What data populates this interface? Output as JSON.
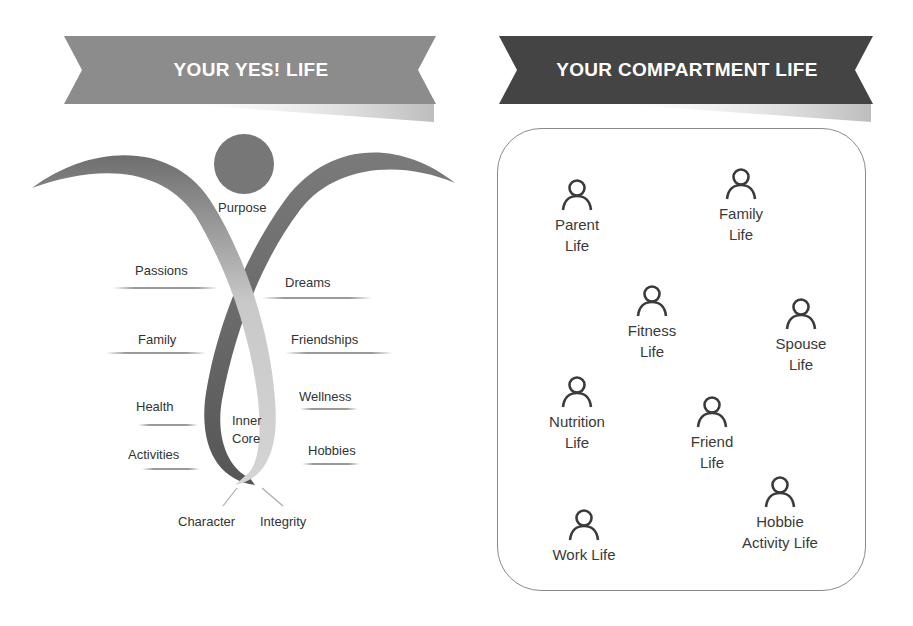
{
  "left_panel": {
    "banner_title": "YOUR YES! LIFE",
    "banner_color": "#8c8c8c",
    "head_label": "Purpose",
    "labels_left": [
      "Passions",
      "Family",
      "Health",
      "Activities"
    ],
    "labels_right": [
      "Dreams",
      "Friendships",
      "Wellness",
      "Hobbies"
    ],
    "core_label_line1": "Inner",
    "core_label_line2": "Core",
    "base_labels": [
      "Character",
      "Integrity"
    ]
  },
  "right_panel": {
    "banner_title": "YOUR COMPARTMENT LIFE",
    "banner_color": "#444444",
    "people": [
      {
        "line1": "Parent",
        "line2": "Life"
      },
      {
        "line1": "Family",
        "line2": "Life"
      },
      {
        "line1": "Fitness",
        "line2": "Life"
      },
      {
        "line1": "Spouse",
        "line2": "Life"
      },
      {
        "line1": "Nutrition",
        "line2": "Life"
      },
      {
        "line1": "Friend",
        "line2": "Life"
      },
      {
        "line1": "Hobbie",
        "line2": "Activity Life"
      },
      {
        "line1": "Work Life",
        "line2": ""
      }
    ]
  }
}
